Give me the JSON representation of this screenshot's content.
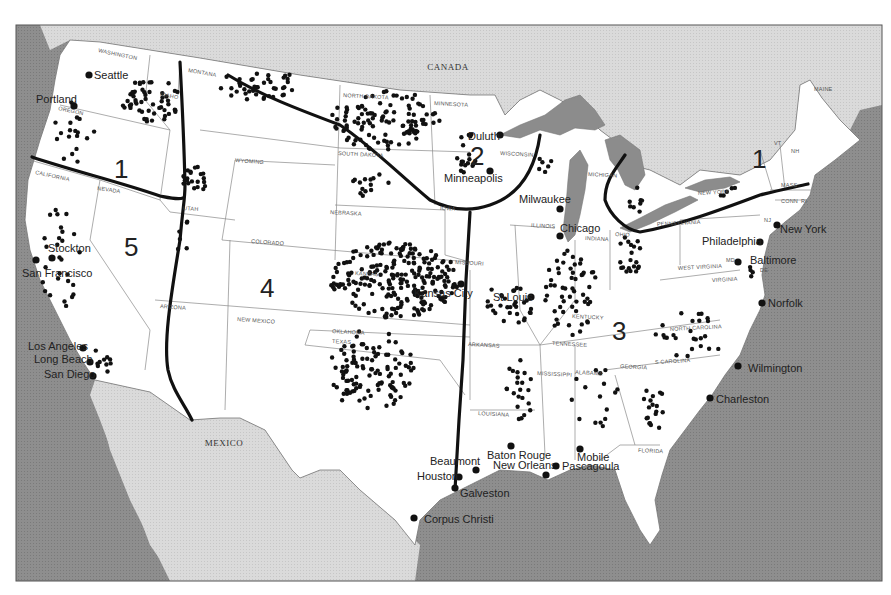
{
  "map": {
    "countries": [
      {
        "name": "CANADA",
        "x": 448,
        "y": 70
      },
      {
        "name": "MEXICO",
        "x": 224,
        "y": 446
      }
    ],
    "regions": [
      {
        "number": "1",
        "x": 114,
        "y": 178,
        "label": "Region 1 (West Coast north)"
      },
      {
        "number": "2",
        "x": 470,
        "y": 165
      },
      {
        "number": "1",
        "x": 752,
        "y": 168
      },
      {
        "number": "5",
        "x": 124,
        "y": 256
      },
      {
        "number": "4",
        "x": 260,
        "y": 297
      },
      {
        "number": "3",
        "x": 612,
        "y": 340
      }
    ],
    "cities": [
      {
        "name": "Seattle",
        "x": 89,
        "y": 75,
        "lx": 94,
        "ly": 79,
        "anchor": "start"
      },
      {
        "name": "Portland",
        "x": 74,
        "y": 106,
        "lx": 36,
        "ly": 103,
        "anchor": "start"
      },
      {
        "name": "Stockton",
        "x": 52,
        "y": 258,
        "lx": 48,
        "ly": 252,
        "anchor": "start"
      },
      {
        "name": "San Francisco",
        "x": 36,
        "y": 260,
        "lx": 22,
        "ly": 277,
        "anchor": "start"
      },
      {
        "name": "Los Angeles",
        "x": 83,
        "y": 348,
        "lx": 28,
        "ly": 350,
        "anchor": "start"
      },
      {
        "name": "Long Beach",
        "x": 90,
        "y": 362,
        "lx": 34,
        "ly": 363,
        "anchor": "start"
      },
      {
        "name": "San Diego",
        "x": 93,
        "y": 376,
        "lx": 44,
        "ly": 378,
        "anchor": "start"
      },
      {
        "name": "Duluth",
        "x": 500,
        "y": 135,
        "lx": 468,
        "ly": 140,
        "anchor": "start"
      },
      {
        "name": "Minneapolis",
        "x": 490,
        "y": 171,
        "lx": 444,
        "ly": 182,
        "anchor": "start"
      },
      {
        "name": "Milwaukee",
        "x": 560,
        "y": 209,
        "lx": 519,
        "ly": 203,
        "anchor": "start"
      },
      {
        "name": "Chicago",
        "x": 560,
        "y": 236,
        "lx": 560,
        "ly": 232,
        "anchor": "start"
      },
      {
        "name": "Kansas City",
        "x": 461,
        "y": 284,
        "lx": 414,
        "ly": 297,
        "anchor": "start"
      },
      {
        "name": "St Louis",
        "x": 531,
        "y": 297,
        "lx": 493,
        "ly": 301,
        "anchor": "start"
      },
      {
        "name": "New York",
        "x": 777,
        "y": 225,
        "lx": 780,
        "ly": 233,
        "anchor": "start"
      },
      {
        "name": "Philadelphia",
        "x": 760,
        "y": 242,
        "lx": 702,
        "ly": 245,
        "anchor": "start"
      },
      {
        "name": "Baltimore",
        "x": 738,
        "y": 262,
        "lx": 750,
        "ly": 264,
        "anchor": "start"
      },
      {
        "name": "Norfolk",
        "x": 762,
        "y": 303,
        "lx": 768,
        "ly": 307,
        "anchor": "start"
      },
      {
        "name": "Wilmington",
        "x": 738,
        "y": 366,
        "lx": 748,
        "ly": 372,
        "anchor": "start"
      },
      {
        "name": "Charleston",
        "x": 710,
        "y": 398,
        "lx": 716,
        "ly": 403,
        "anchor": "start"
      },
      {
        "name": "Beaumont",
        "x": 476,
        "y": 470,
        "lx": 430,
        "ly": 465,
        "anchor": "start"
      },
      {
        "name": "Houston",
        "x": 459,
        "y": 477,
        "lx": 417,
        "ly": 480,
        "anchor": "start"
      },
      {
        "name": "Galveston",
        "x": 455,
        "y": 488,
        "lx": 460,
        "ly": 497,
        "anchor": "start"
      },
      {
        "name": "Corpus Christi",
        "x": 414,
        "y": 518,
        "lx": 424,
        "ly": 523,
        "anchor": "start"
      },
      {
        "name": "Baton Rouge",
        "x": 511,
        "y": 446,
        "lx": 487,
        "ly": 459,
        "anchor": "start"
      },
      {
        "name": "New Orleans",
        "x": 546,
        "y": 475,
        "lx": 493,
        "ly": 469,
        "anchor": "start"
      },
      {
        "name": "Pascagoula",
        "x": 556,
        "y": 466,
        "lx": 562,
        "ly": 470,
        "anchor": "start"
      },
      {
        "name": "Mobile",
        "x": 580,
        "y": 449,
        "lx": 577,
        "ly": 461,
        "anchor": "start"
      }
    ],
    "states": [
      {
        "name": "WASHINGTON",
        "x": 98,
        "y": 52,
        "rot": 12
      },
      {
        "name": "OREGON",
        "x": 58,
        "y": 110,
        "rot": 12
      },
      {
        "name": "IDAHO",
        "x": 160,
        "y": 96,
        "rot": 10
      },
      {
        "name": "MONTANA",
        "x": 188,
        "y": 72,
        "rot": 10
      },
      {
        "name": "CALIFORNIA",
        "x": 35,
        "y": 174,
        "rot": 12
      },
      {
        "name": "NEVADA",
        "x": 97,
        "y": 190,
        "rot": 8
      },
      {
        "name": "WYOMING",
        "x": 235,
        "y": 162,
        "rot": 4
      },
      {
        "name": "UTAH",
        "x": 183,
        "y": 210,
        "rot": 4
      },
      {
        "name": "COLORADO",
        "x": 251,
        "y": 243,
        "rot": 4
      },
      {
        "name": "ARIZONA",
        "x": 160,
        "y": 308,
        "rot": 4
      },
      {
        "name": "NEW MEXICO",
        "x": 237,
        "y": 321,
        "rot": 4
      },
      {
        "name": "NORTH DAKOTA",
        "x": 343,
        "y": 97,
        "rot": 3
      },
      {
        "name": "SOUTH DAKOTA",
        "x": 338,
        "y": 155,
        "rot": 3
      },
      {
        "name": "NEBRASKA",
        "x": 330,
        "y": 214,
        "rot": 3
      },
      {
        "name": "KANSAS",
        "x": 355,
        "y": 275,
        "rot": 3
      },
      {
        "name": "OKLAHOMA",
        "x": 332,
        "y": 333,
        "rot": 3
      },
      {
        "name": "TEXAS",
        "x": 332,
        "y": 343,
        "rot": 3
      },
      {
        "name": "MINNESOTA",
        "x": 434,
        "y": 105,
        "rot": 3
      },
      {
        "name": "WISCONSIN",
        "x": 500,
        "y": 155,
        "rot": 3
      },
      {
        "name": "IOWA",
        "x": 440,
        "y": 210,
        "rot": 3
      },
      {
        "name": "MISSOURI",
        "x": 455,
        "y": 264,
        "rot": 3
      },
      {
        "name": "ILLINOIS",
        "x": 531,
        "y": 227,
        "rot": 3
      },
      {
        "name": "INDIANA",
        "x": 585,
        "y": 240,
        "rot": 3
      },
      {
        "name": "OHIO",
        "x": 615,
        "y": 236,
        "rot": 3
      },
      {
        "name": "MICHIGAN",
        "x": 588,
        "y": 176,
        "rot": 3
      },
      {
        "name": "ARKANSAS",
        "x": 468,
        "y": 346,
        "rot": 3
      },
      {
        "name": "LOUISIANA",
        "x": 478,
        "y": 415,
        "rot": 3
      },
      {
        "name": "MISSISSIPPI",
        "x": 537,
        "y": 375,
        "rot": 3
      },
      {
        "name": "ALABAMA",
        "x": 575,
        "y": 374,
        "rot": 3
      },
      {
        "name": "TENNESSEE",
        "x": 552,
        "y": 345,
        "rot": 3
      },
      {
        "name": "KENTUCKY",
        "x": 572,
        "y": 318,
        "rot": 3
      },
      {
        "name": "GEORGIA",
        "x": 620,
        "y": 368,
        "rot": 3
      },
      {
        "name": "S CAROLINA",
        "x": 655,
        "y": 364,
        "rot": -3
      },
      {
        "name": "NORTH CAROLINA",
        "x": 670,
        "y": 331,
        "rot": -3
      },
      {
        "name": "VIRGINIA",
        "x": 712,
        "y": 282,
        "rot": -3
      },
      {
        "name": "WEST VIRGINIA",
        "x": 678,
        "y": 270,
        "rot": -3
      },
      {
        "name": "FLORIDA",
        "x": 638,
        "y": 452,
        "rot": 3
      },
      {
        "name": "PENNSYLVANIA",
        "x": 657,
        "y": 226,
        "rot": -3
      },
      {
        "name": "NEW YORK",
        "x": 698,
        "y": 195,
        "rot": -3
      },
      {
        "name": "MASS",
        "x": 781,
        "y": 187,
        "rot": 0
      },
      {
        "name": "CONN",
        "x": 781,
        "y": 203,
        "rot": 0
      },
      {
        "name": "RI",
        "x": 801,
        "y": 203,
        "rot": 0
      },
      {
        "name": "VT",
        "x": 774,
        "y": 145,
        "rot": 0
      },
      {
        "name": "NH",
        "x": 791,
        "y": 153,
        "rot": 0
      },
      {
        "name": "MAINE",
        "x": 814,
        "y": 91,
        "rot": 0
      },
      {
        "name": "NJ",
        "x": 764,
        "y": 222,
        "rot": 0
      },
      {
        "name": "MD",
        "x": 726,
        "y": 262,
        "rot": 0
      },
      {
        "name": "DE",
        "x": 760,
        "y": 272,
        "rot": 0
      }
    ],
    "colors": {
      "ocean": "#8c8c8c",
      "foreign_land": "#d9d9d9",
      "us_land": "#ffffff",
      "region_lines": "#111111",
      "dots": "#111111"
    }
  }
}
